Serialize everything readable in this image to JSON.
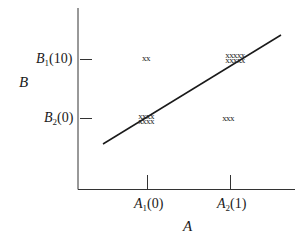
{
  "diagram": {
    "type": "scatter-with-regression",
    "x_axis": {
      "name": "A",
      "ticks": [
        {
          "letter": "A",
          "sub": "1",
          "value": "(0)"
        },
        {
          "letter": "A",
          "sub": "2",
          "value": "(1)"
        }
      ]
    },
    "y_axis": {
      "name": "B",
      "ticks": [
        {
          "letter": "B",
          "sub": "1",
          "value": "(10)"
        },
        {
          "letter": "B",
          "sub": "2",
          "value": "(0)"
        }
      ]
    },
    "clusters": [
      {
        "cell": "A1-B1",
        "rows": [
          "xx"
        ],
        "count": 2
      },
      {
        "cell": "A2-B1",
        "rows": [
          "xxxxx",
          "xxxxx"
        ],
        "count": 10
      },
      {
        "cell": "A1-B2",
        "rows": [
          "xxxx",
          "xxxx"
        ],
        "count": 8
      },
      {
        "cell": "A2-B2",
        "rows": [
          "xxx"
        ],
        "count": 3
      }
    ],
    "line_color": "#1a1a1a"
  }
}
